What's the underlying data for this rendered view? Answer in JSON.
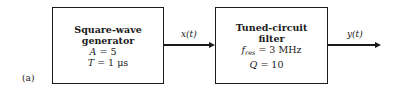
{
  "figure_label": "(a)",
  "blocks": [
    {
      "id": "square-wave-generator",
      "title_lines": [
        "Square-wave",
        "generator"
      ],
      "params": [
        {
          "symbol": "A",
          "subscript": "",
          "value": "= 5"
        },
        {
          "symbol": "T",
          "subscript": "",
          "value": "= 1 μs"
        }
      ]
    },
    {
      "id": "tuned-circuit-filter",
      "title_lines": [
        "Tuned-circuit",
        "filter"
      ],
      "params": [
        {
          "symbol": "f",
          "subscript": "res",
          "value": "= 3 MHz"
        },
        {
          "symbol": "Q",
          "subscript": "",
          "value": "= 10"
        }
      ]
    }
  ],
  "signals": [
    {
      "name": "x(t)",
      "from": "square-wave-generator",
      "to": "tuned-circuit-filter"
    },
    {
      "name": "y(t)",
      "from": "tuned-circuit-filter",
      "to": "output"
    }
  ]
}
